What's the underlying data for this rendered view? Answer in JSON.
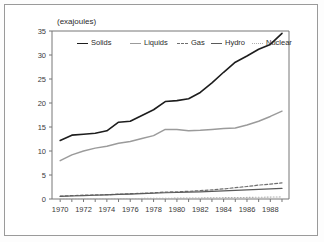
{
  "figure": {
    "unit_label": "(exajoules)"
  },
  "chart_data": {
    "type": "line",
    "title": "",
    "subtitle": "",
    "xlabel": "",
    "ylabel": "(exajoules)",
    "ylim": [
      0,
      35
    ],
    "xlim": [
      1969.3,
      1989.6
    ],
    "grid": false,
    "legend_position": "top-inside",
    "ytick_labels": [
      "0",
      "5",
      "10",
      "15",
      "20",
      "25",
      "30",
      "35"
    ],
    "ytick_values": [
      0,
      5,
      10,
      15,
      20,
      25,
      30,
      35
    ],
    "xtick_labels": [
      "1970",
      "1972",
      "1974",
      "1976",
      "1978",
      "1980",
      "1982",
      "1984",
      "1986",
      "1988"
    ],
    "xtick_values": [
      1970,
      1972,
      1974,
      1976,
      1978,
      1980,
      1982,
      1984,
      1986,
      1988
    ],
    "x_minor_ticks": [
      1970,
      1971,
      1972,
      1973,
      1974,
      1975,
      1976,
      1977,
      1978,
      1979,
      1980,
      1981,
      1982,
      1983,
      1984,
      1985,
      1986,
      1987,
      1988,
      1989
    ],
    "x": [
      1970,
      1971,
      1972,
      1973,
      1974,
      1975,
      1976,
      1977,
      1978,
      1979,
      1980,
      1981,
      1982,
      1983,
      1984,
      1985,
      1986,
      1987,
      1988,
      1989
    ],
    "series": [
      {
        "name": "Solids",
        "color": "#1d1d1d",
        "style": "solid",
        "width": 1.6,
        "values": [
          12.2,
          13.3,
          13.5,
          13.7,
          14.2,
          16.0,
          16.2,
          17.4,
          18.6,
          20.3,
          20.5,
          20.9,
          22.2,
          24.2,
          26.4,
          28.5,
          29.8,
          31.2,
          32.2,
          34.5
        ]
      },
      {
        "name": "Liquids",
        "color": "#9b9b9b",
        "style": "solid",
        "width": 1.5,
        "values": [
          8.0,
          9.2,
          10.0,
          10.6,
          11.0,
          11.6,
          12.0,
          12.6,
          13.2,
          14.5,
          14.5,
          14.2,
          14.3,
          14.5,
          14.7,
          14.8,
          15.4,
          16.2,
          17.2,
          18.3
        ]
      },
      {
        "name": "Gas",
        "color": "#6f6f6f",
        "style": "dashed",
        "width": 1.2,
        "values": [
          0.6,
          0.7,
          0.8,
          0.85,
          0.9,
          1.0,
          1.1,
          1.2,
          1.3,
          1.45,
          1.5,
          1.6,
          1.75,
          1.9,
          2.1,
          2.35,
          2.6,
          2.9,
          3.1,
          3.35
        ]
      },
      {
        "name": "Hydro",
        "color": "#5a5a5a",
        "style": "solid",
        "width": 1.2,
        "values": [
          0.55,
          0.62,
          0.7,
          0.78,
          0.85,
          0.95,
          1.0,
          1.1,
          1.2,
          1.3,
          1.35,
          1.45,
          1.5,
          1.6,
          1.7,
          1.8,
          1.9,
          2.0,
          2.1,
          2.2
        ]
      },
      {
        "name": "Nuclear",
        "color": "#b0b0b0",
        "style": "dotted",
        "width": 1.1,
        "values": [
          0.02,
          0.03,
          0.04,
          0.05,
          0.06,
          0.08,
          0.1,
          0.12,
          0.14,
          0.16,
          0.18,
          0.2,
          0.22,
          0.25,
          0.28,
          0.3,
          0.33,
          0.36,
          0.4,
          0.44
        ]
      }
    ],
    "legend": [
      {
        "label": "Solids",
        "swatch": "sw-solid-dark"
      },
      {
        "label": "Liquids",
        "swatch": "sw-solid-mid"
      },
      {
        "label": "Gas",
        "swatch": "sw-dashed"
      },
      {
        "label": "Hydro",
        "swatch": "sw-solid-med"
      },
      {
        "label": "Nuclear",
        "swatch": "sw-dotted"
      }
    ]
  }
}
